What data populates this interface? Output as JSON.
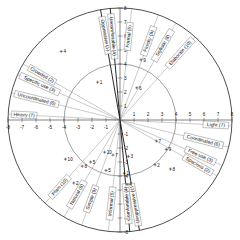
{
  "figure": {
    "type": "polar-semantic-differential",
    "center": {
      "x": 120,
      "y": 120
    },
    "outer_radius": 112,
    "inner_radius": 56,
    "axis_max": 8,
    "axis_min": -8
  },
  "axes": {
    "horizontal": {
      "left_label": "Heavy (7)",
      "right_label": "Light (7)",
      "ticks": [
        "-8",
        "-7",
        "-6",
        "-5",
        "-4",
        "-3",
        "-2",
        "-1",
        "1",
        "2",
        "3",
        "4",
        "5",
        "6",
        "7",
        "8"
      ]
    },
    "vertical": {
      "ticks": [
        "8",
        "7",
        "6",
        "5",
        "4",
        "3",
        "2",
        "1",
        "-1",
        "-2",
        "-3",
        "-4",
        "-5",
        "-6",
        "-7",
        "-8"
      ]
    }
  },
  "chart_data": {
    "type": "line",
    "title": "",
    "xlabel": "",
    "ylabel": "",
    "xlim": [
      -8,
      8
    ],
    "ylim": [
      -8,
      8
    ],
    "grid": true,
    "legend": "none",
    "categories": [
      "Oppressive / Unoppressive",
      "Spacious / Crowded",
      "Free use / Specific use",
      "Comfortable / Uncomfortable",
      "Formal / Informal",
      "Coordinated / Uncoordinated",
      "Light / Heavy",
      "Stylistic / Natural",
      "Finicky / Simple",
      "Elaborate / Plain"
    ],
    "values": [
      1,
      2,
      3,
      4,
      5,
      6,
      7,
      8,
      9,
      10
    ],
    "annotations": [
      "Each bipolar adjective pair forms one diameter through the origin",
      "Inner circle marks the scale value 4; outer circle marks the scale value 8"
    ]
  },
  "pole_labels": [
    {
      "id": "oppressive",
      "text": "Oppressive (1)",
      "pair": 1,
      "side": "negative",
      "angle_deg": 100,
      "radius": 86
    },
    {
      "id": "unoppressive",
      "text": "Unoppressive (1)",
      "pair": 1,
      "side": "positive",
      "angle_deg": 280,
      "radius": 86
    },
    {
      "id": "uncomfortable",
      "text": "Uncomfortable (4)",
      "pair": 4,
      "side": "negative",
      "angle_deg": 95,
      "radius": 84
    },
    {
      "id": "comfortable",
      "text": "Comfortable (4)",
      "pair": 4,
      "side": "positive",
      "angle_deg": 275,
      "radius": 84
    },
    {
      "id": "formal",
      "text": "Formal (5)",
      "pair": 5,
      "side": "positive",
      "angle_deg": 84,
      "radius": 84
    },
    {
      "id": "informal",
      "text": "Informal (5)",
      "pair": 5,
      "side": "negative",
      "angle_deg": 264,
      "radius": 84
    },
    {
      "id": "finicky",
      "text": "Finicky (9)",
      "pair": 9,
      "side": "positive",
      "angle_deg": 70,
      "radius": 84
    },
    {
      "id": "simple",
      "text": "Simple (9)",
      "pair": 9,
      "side": "negative",
      "angle_deg": 250,
      "radius": 84
    },
    {
      "id": "stylistic",
      "text": "Stylistic (8)",
      "pair": 8,
      "side": "positive",
      "angle_deg": 60,
      "radius": 86
    },
    {
      "id": "natural",
      "text": "Natural (8)",
      "pair": 8,
      "side": "negative",
      "angle_deg": 240,
      "radius": 86
    },
    {
      "id": "elaborate",
      "text": "Elaborate (10)",
      "pair": 10,
      "side": "positive",
      "angle_deg": 48,
      "radius": 90
    },
    {
      "id": "plain",
      "text": "Plain (10)",
      "pair": 10,
      "side": "negative",
      "angle_deg": 228,
      "radius": 90
    },
    {
      "id": "coordinated",
      "text": "Coordinated (6)",
      "pair": 6,
      "side": "positive",
      "angle_deg": -14,
      "radius": 86
    },
    {
      "id": "uncoordinated",
      "text": "Uncoordinated (6)",
      "pair": 6,
      "side": "negative",
      "angle_deg": 166,
      "radius": 86
    },
    {
      "id": "free-use",
      "text": "Free use (3)",
      "pair": 3,
      "side": "positive",
      "angle_deg": -24,
      "radius": 88
    },
    {
      "id": "specific-use",
      "text": "Specific use (3)",
      "pair": 3,
      "side": "negative",
      "angle_deg": 156,
      "radius": 88
    },
    {
      "id": "spacious",
      "text": "Spacious (2)",
      "pair": 2,
      "side": "positive",
      "angle_deg": -30,
      "radius": 90
    },
    {
      "id": "crowded",
      "text": "Crowded (2)",
      "pair": 2,
      "side": "negative",
      "angle_deg": 150,
      "radius": 90
    },
    {
      "id": "light",
      "text": "Light (7)",
      "pair": 7,
      "side": "positive",
      "angle_deg": -3,
      "radius": 96
    },
    {
      "id": "heavy",
      "text": "Heavy (7)",
      "pair": 7,
      "side": "negative",
      "angle_deg": 177,
      "radius": 96
    }
  ],
  "point_markers": [
    {
      "label": "4",
      "x": -4.2,
      "y": 4.9
    },
    {
      "label": "1",
      "x": -1.6,
      "y": 2.7
    },
    {
      "label": "9",
      "x": 1.5,
      "y": 4.3
    },
    {
      "label": "6",
      "x": 1.2,
      "y": 2.3
    },
    {
      "label": "7",
      "x": 2.6,
      "y": -1.5
    },
    {
      "label": "9",
      "x": 3.3,
      "y": -2.1
    },
    {
      "label": "2",
      "x": 2.5,
      "y": -3.2
    },
    {
      "label": "8",
      "x": 3.6,
      "y": -3.5
    },
    {
      "label": "4",
      "x": 0.5,
      "y": -4.6
    },
    {
      "label": "1",
      "x": 0.3,
      "y": -3.8
    },
    {
      "label": "3",
      "x": 0.6,
      "y": -2.6
    },
    {
      "label": "5",
      "x": -1.0,
      "y": -3.6
    },
    {
      "label": "7",
      "x": -0.5,
      "y": -2.5
    },
    {
      "label": "10",
      "x": -1.1,
      "y": -2.3
    },
    {
      "label": "5",
      "x": -2.1,
      "y": -3.0
    },
    {
      "label": "8",
      "x": -2.7,
      "y": -3.3
    },
    {
      "label": "10",
      "x": -3.9,
      "y": -2.8
    },
    {
      "label": "2",
      "x": -3.3,
      "y": -4.5
    }
  ]
}
